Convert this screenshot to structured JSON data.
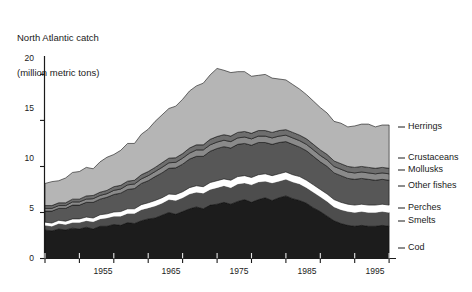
{
  "chart_data": {
    "type": "area",
    "stacked": true,
    "title": "North Atlantic catch",
    "subtitle": "(million metric tons)",
    "title_line1": "North Atlantic catch",
    "title_line2": "(million metric tons)",
    "xlabel": "",
    "ylabel": "million metric tons",
    "xlim": [
      1950,
      2001
    ],
    "ylim": [
      0,
      22
    ],
    "yticks": [
      0,
      5,
      10,
      15,
      20
    ],
    "ytick_labels": [
      "0",
      "5",
      "10",
      "15",
      "20"
    ],
    "xticks": [
      1955,
      1965,
      1975,
      1985,
      1995
    ],
    "xtick_labels": [
      "1955",
      "1965",
      "1975",
      "1985",
      "1995"
    ],
    "xticks_minor": [
      1950,
      1960,
      1970,
      1980,
      1990,
      2000
    ],
    "grid": false,
    "legend_position": "right",
    "x": [
      1950,
      1951,
      1952,
      1953,
      1954,
      1955,
      1956,
      1957,
      1958,
      1959,
      1960,
      1961,
      1962,
      1963,
      1964,
      1965,
      1966,
      1967,
      1968,
      1969,
      1970,
      1971,
      1972,
      1973,
      1974,
      1975,
      1976,
      1977,
      1978,
      1979,
      1980,
      1981,
      1982,
      1983,
      1984,
      1985,
      1986,
      1987,
      1988,
      1989,
      1990,
      1991,
      1992,
      1993,
      1994,
      1995,
      1996,
      1997,
      1998,
      1999,
      2000
    ],
    "series": [
      {
        "name": "Cod",
        "color": "#1c1c1c",
        "values": [
          3.1,
          3.0,
          3.2,
          3.1,
          3.3,
          3.2,
          3.4,
          3.2,
          3.5,
          3.5,
          3.7,
          3.6,
          3.9,
          3.8,
          4.1,
          4.3,
          4.4,
          4.7,
          5.0,
          4.8,
          5.1,
          5.4,
          5.6,
          5.4,
          5.8,
          5.9,
          6.1,
          5.9,
          6.2,
          6.4,
          6.1,
          6.4,
          6.6,
          6.3,
          6.6,
          6.8,
          6.5,
          6.3,
          6.0,
          5.5,
          5.1,
          4.6,
          4.1,
          3.8,
          3.6,
          3.5,
          3.6,
          3.5,
          3.5,
          3.6,
          3.5
        ]
      },
      {
        "name": "Smelts",
        "color": "#4d4d4d",
        "values": [
          0.5,
          0.5,
          0.6,
          0.6,
          0.6,
          0.7,
          0.7,
          0.8,
          0.8,
          0.9,
          0.9,
          1.0,
          1.0,
          1.1,
          1.2,
          1.2,
          1.3,
          1.3,
          1.4,
          1.5,
          1.5,
          1.6,
          1.6,
          1.7,
          1.7,
          1.8,
          1.8,
          1.8,
          1.9,
          1.8,
          1.9,
          1.9,
          1.8,
          1.9,
          1.8,
          1.8,
          1.8,
          1.8,
          1.7,
          1.7,
          1.6,
          1.6,
          1.5,
          1.5,
          1.5,
          1.5,
          1.5,
          1.5,
          1.5,
          1.5,
          1.5
        ]
      },
      {
        "name": "Perches",
        "color": "#ffffff",
        "values": [
          0.35,
          0.35,
          0.35,
          0.35,
          0.4,
          0.4,
          0.4,
          0.4,
          0.45,
          0.45,
          0.45,
          0.5,
          0.5,
          0.5,
          0.55,
          0.55,
          0.6,
          0.6,
          0.6,
          0.65,
          0.65,
          0.7,
          0.7,
          0.7,
          0.75,
          0.75,
          0.75,
          0.8,
          0.8,
          0.8,
          0.8,
          0.8,
          0.8,
          0.8,
          0.8,
          0.8,
          0.8,
          0.8,
          0.8,
          0.8,
          0.8,
          0.8,
          0.8,
          0.8,
          0.8,
          0.8,
          0.8,
          0.8,
          0.8,
          0.8,
          0.8
        ]
      },
      {
        "name": "Other fishes",
        "color": "#575757",
        "values": [
          1.2,
          1.3,
          1.3,
          1.4,
          1.5,
          1.5,
          1.6,
          1.7,
          1.7,
          1.8,
          1.9,
          2.0,
          2.1,
          2.2,
          2.3,
          2.4,
          2.6,
          2.7,
          2.8,
          2.9,
          3.0,
          3.1,
          3.2,
          3.3,
          3.4,
          3.5,
          3.5,
          3.5,
          3.5,
          3.5,
          3.5,
          3.5,
          3.4,
          3.4,
          3.4,
          3.3,
          3.3,
          3.2,
          3.2,
          3.1,
          3.0,
          3.0,
          2.9,
          2.9,
          2.8,
          2.8,
          2.8,
          2.8,
          2.7,
          2.7,
          2.7
        ]
      },
      {
        "name": "Mollusks",
        "color": "#8a8a8a",
        "values": [
          0.3,
          0.3,
          0.3,
          0.3,
          0.35,
          0.35,
          0.35,
          0.4,
          0.4,
          0.4,
          0.45,
          0.45,
          0.5,
          0.5,
          0.5,
          0.55,
          0.55,
          0.6,
          0.6,
          0.6,
          0.65,
          0.65,
          0.7,
          0.7,
          0.7,
          0.7,
          0.7,
          0.7,
          0.7,
          0.7,
          0.7,
          0.7,
          0.7,
          0.7,
          0.7,
          0.7,
          0.7,
          0.7,
          0.7,
          0.7,
          0.7,
          0.7,
          0.7,
          0.7,
          0.7,
          0.7,
          0.7,
          0.7,
          0.7,
          0.7,
          0.7
        ]
      },
      {
        "name": "Crustaceans",
        "color": "#6e6e6e",
        "values": [
          0.3,
          0.3,
          0.3,
          0.3,
          0.3,
          0.3,
          0.35,
          0.35,
          0.35,
          0.35,
          0.4,
          0.4,
          0.4,
          0.4,
          0.45,
          0.45,
          0.45,
          0.5,
          0.5,
          0.5,
          0.5,
          0.55,
          0.55,
          0.55,
          0.6,
          0.6,
          0.6,
          0.6,
          0.6,
          0.6,
          0.6,
          0.6,
          0.6,
          0.6,
          0.6,
          0.6,
          0.6,
          0.6,
          0.6,
          0.6,
          0.6,
          0.6,
          0.6,
          0.6,
          0.6,
          0.6,
          0.6,
          0.6,
          0.6,
          0.6,
          0.6
        ]
      },
      {
        "name": "Herrings",
        "color": "#b5b5b5",
        "values": [
          2.4,
          2.6,
          2.4,
          2.7,
          2.9,
          3.0,
          3.1,
          2.9,
          3.3,
          3.6,
          3.5,
          3.8,
          4.1,
          4.0,
          4.4,
          4.6,
          5.0,
          5.2,
          5.4,
          5.6,
          5.9,
          6.2,
          6.4,
          6.7,
          7.0,
          7.4,
          7.0,
          6.9,
          6.6,
          6.5,
          6.2,
          6.0,
          6.1,
          5.9,
          5.6,
          5.4,
          5.2,
          5.0,
          4.8,
          4.7,
          4.6,
          4.5,
          4.3,
          4.4,
          4.3,
          4.5,
          4.6,
          4.7,
          4.5,
          4.6,
          4.7
        ]
      }
    ],
    "totals_note": "Total North Atlantic catch peaked near 21 million metric tons around 1975 and declined to about 14-15 by 2000."
  },
  "legend": {
    "items": [
      {
        "label": "Herrings",
        "y": 127
      },
      {
        "label": "Crustaceans",
        "y": 158
      },
      {
        "label": "Mollusks",
        "y": 170
      },
      {
        "label": "Other fishes",
        "y": 186
      },
      {
        "label": "Perches",
        "y": 208
      },
      {
        "label": "Smelts",
        "y": 221
      },
      {
        "label": "Cod",
        "y": 248
      }
    ]
  },
  "axes": {
    "y_tick_labels": [
      {
        "text": "20",
        "y": 53
      },
      {
        "text": "15",
        "y": 103
      },
      {
        "text": "10",
        "y": 153
      },
      {
        "text": "5",
        "y": 203
      },
      {
        "text": "0",
        "y": 253
      }
    ],
    "x_tick_labels": [
      {
        "text": "1955",
        "x": 103
      },
      {
        "text": "1965",
        "x": 171
      },
      {
        "text": "1975",
        "x": 239
      },
      {
        "text": "1985",
        "x": 307
      },
      {
        "text": "1995",
        "x": 375
      }
    ]
  },
  "colors": {
    "axis": "#1a1a1a",
    "text": "#1a1a1a",
    "background": "#ffffff",
    "band_cod": "#1c1c1c",
    "band_smelts": "#4d4d4d",
    "band_perches": "#ffffff",
    "band_other_fishes": "#575757",
    "band_mollusks": "#8a8a8a",
    "band_crustaceans": "#6e6e6e",
    "band_herrings": "#b5b5b5"
  }
}
